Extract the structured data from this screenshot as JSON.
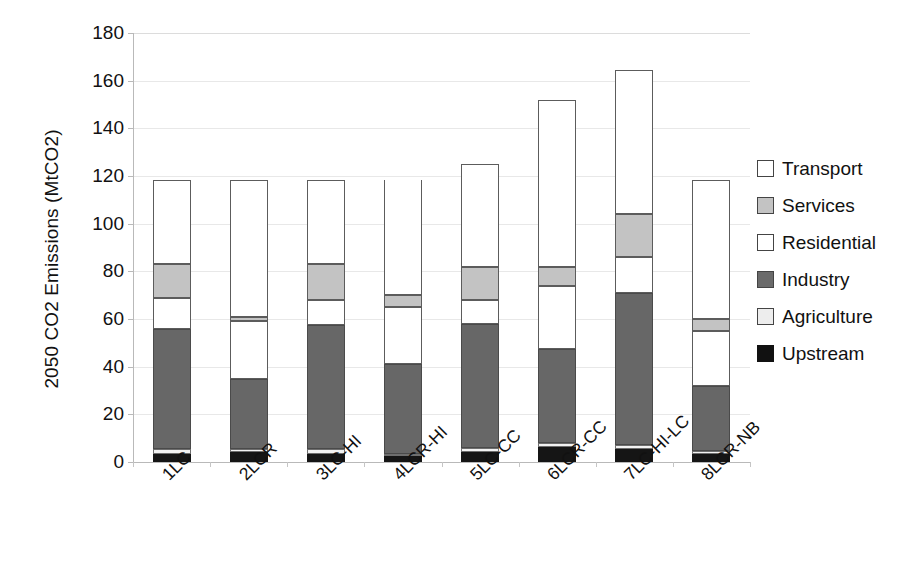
{
  "chart_data": {
    "type": "bar",
    "subtype": "stacked-bar",
    "title": "",
    "xlabel": "",
    "ylabel": "2050 CO2 Emissions (MtCO2)",
    "ylim": [
      0,
      180
    ],
    "ytick_step": 20,
    "yticks": [
      0,
      20,
      40,
      60,
      80,
      100,
      120,
      140,
      160,
      180
    ],
    "ytick_labels": [
      "0",
      "20",
      "40",
      "60",
      "80",
      "100",
      "120",
      "140",
      "160",
      "180"
    ],
    "grid": "horizontal-faint",
    "legend_position": "right",
    "categories": [
      "1LC",
      "2LCR",
      "3LC-HI",
      "4LCR-HI",
      "5LC-CC",
      "6LCR-CC",
      "7LC-HI-LC",
      "8LCR-NB"
    ],
    "stack_order_bottom_to_top": [
      "Upstream",
      "Agriculture",
      "Industry",
      "Residential",
      "Services",
      "Transport"
    ],
    "series": [
      {
        "name": "Upstream",
        "color": "#151515",
        "values": [
          3.5,
          4.0,
          3.5,
          2.5,
          4.0,
          6.5,
          5.5,
          3.5
        ]
      },
      {
        "name": "Agriculture",
        "color": "#f2f2f2",
        "values": [
          1.8,
          1.5,
          1.8,
          1.0,
          1.8,
          1.5,
          1.5,
          1.3
        ]
      },
      {
        "name": "Industry",
        "color": "#676767",
        "values": [
          50.7,
          29.5,
          52.2,
          37.5,
          52.2,
          39.5,
          64.0,
          27.2
        ]
      },
      {
        "name": "Residential",
        "color": "#ffffff",
        "values": [
          13.0,
          24.0,
          10.5,
          24.0,
          10.0,
          26.5,
          15.0,
          23.0
        ]
      },
      {
        "name": "Services",
        "color": "#c3c3c3",
        "values": [
          14.0,
          2.0,
          15.0,
          5.0,
          14.0,
          8.0,
          18.0,
          5.0
        ]
      },
      {
        "name": "Transport",
        "color": "#ffffff",
        "values": [
          35.5,
          57.5,
          35.5,
          48.5,
          43.0,
          70.0,
          60.5,
          58.5
        ]
      }
    ],
    "totals": [
      118.5,
      118.5,
      118.5,
      118.5,
      125.0,
      152.0,
      177.5,
      118.5
    ],
    "legend_entries": [
      {
        "label": "Transport",
        "swatch": "white-outline"
      },
      {
        "label": "Services",
        "swatch": "light-gray"
      },
      {
        "label": "Residential",
        "swatch": "white-outline"
      },
      {
        "label": "Industry",
        "swatch": "dark-gray"
      },
      {
        "label": "Agriculture",
        "swatch": "very-light-gray"
      },
      {
        "label": "Upstream",
        "swatch": "black"
      }
    ]
  }
}
